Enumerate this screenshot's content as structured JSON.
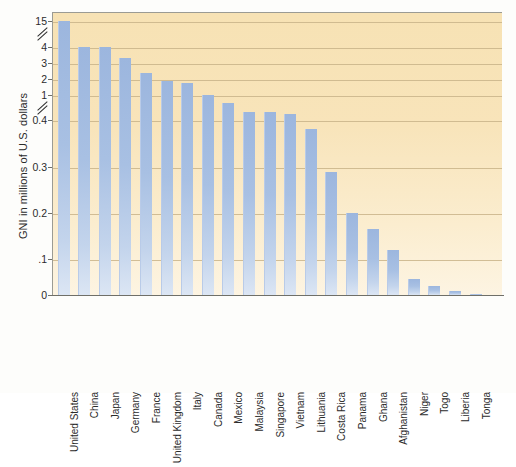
{
  "chart_data": {
    "type": "bar",
    "title": "",
    "subtitle": "",
    "xlabel": "",
    "ylabel": "GNI in millions of U.S. dollars",
    "categories": [
      "United States",
      "China",
      "Japan",
      "Germany",
      "France",
      "United Kingdom",
      "Italy",
      "Canada",
      "Mexico",
      "Malaysia",
      "Singapore",
      "Vietnam",
      "Lithuania",
      "Costa Rica",
      "Panama",
      "Ghana",
      "Afghanistan",
      "Niger",
      "Togo",
      "Liberia",
      "Tonga"
    ],
    "values": [
      15.0,
      4.1,
      4.0,
      3.3,
      2.4,
      1.9,
      1.75,
      1.0,
      0.8,
      0.6,
      0.6,
      0.55,
      0.38,
      0.29,
      0.2,
      0.165,
      0.12,
      0.045,
      0.025,
      0.01,
      0.003
    ],
    "y_tick_labels": [
      "15",
      "4",
      "3",
      "2",
      "1",
      "0.4",
      "0.3",
      "0.2",
      ".1",
      "0"
    ],
    "y_tick_values": [
      15,
      4,
      3,
      2,
      1,
      0.4,
      0.3,
      0.2,
      0.1,
      0
    ],
    "axis_breaks": [
      {
        "between": "15 and 4"
      },
      {
        "between": "1 and 0.4"
      }
    ],
    "y_axis_type": "broken-scale",
    "ylim": [
      0,
      15
    ],
    "grid": true,
    "grid_orientation": "horizontal",
    "legend": "none",
    "legend_position": "none",
    "colors": {
      "bar": "#a8c0e3",
      "plot_background": "#f8e4ba",
      "gridline": "#c9b489",
      "axis": "#6f6f68",
      "text": "#2b2b2b",
      "page_background": "#fdfdfb"
    },
    "annotations": []
  }
}
